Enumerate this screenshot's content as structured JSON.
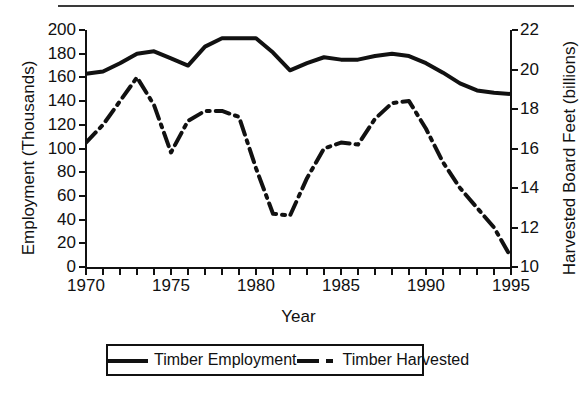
{
  "figure": {
    "has_top_rule": true,
    "background_color": "#ffffff",
    "line_color": "#111111"
  },
  "legend": {
    "position": "below-plot",
    "items": [
      {
        "label": "Timber Employment",
        "style": "solid",
        "icon": "solid-line-swatch-icon"
      },
      {
        "label": "Timber Harvested",
        "style": "dashdot",
        "icon": "dashdot-line-swatch-icon"
      }
    ]
  },
  "chart_data": {
    "type": "line",
    "title": "",
    "subtitle": "",
    "xlabel": "Year",
    "ylabel": "Employment (Thousands)",
    "y2label": "Harvested Board Feet (billions)",
    "xlim": [
      1970,
      1995
    ],
    "ylim": [
      0,
      200
    ],
    "y2lim": [
      10,
      22
    ],
    "grid": false,
    "xticks": [
      1970,
      1975,
      1980,
      1985,
      1990,
      1995
    ],
    "xtick_labels": [
      "1970",
      "1975",
      "1980",
      "1985",
      "1990",
      "1995"
    ],
    "xtick_minor_step": 1,
    "yticks": [
      0,
      20,
      40,
      60,
      80,
      100,
      120,
      140,
      160,
      180,
      200
    ],
    "ytick_labels": [
      "0",
      "20",
      "40",
      "60",
      "80",
      "100",
      "120",
      "140",
      "160",
      "180",
      "200"
    ],
    "y2ticks": [
      10,
      12,
      14,
      16,
      18,
      20,
      22
    ],
    "y2tick_labels": [
      "10",
      "12",
      "14",
      "16",
      "18",
      "20",
      "22"
    ],
    "x": [
      1970,
      1971,
      1972,
      1973,
      1974,
      1975,
      1976,
      1977,
      1978,
      1979,
      1980,
      1981,
      1982,
      1983,
      1984,
      1985,
      1986,
      1987,
      1988,
      1989,
      1990,
      1991,
      1992,
      1993,
      1994,
      1995
    ],
    "series": [
      {
        "name": "Timber Employment",
        "axis": "left",
        "style": "solid",
        "units": "thousands",
        "values": [
          163,
          165,
          172,
          180,
          182,
          176,
          170,
          186,
          193,
          193,
          193,
          181,
          166,
          172,
          177,
          175,
          175,
          178,
          180,
          178,
          172,
          164,
          155,
          149,
          147,
          146
        ]
      },
      {
        "name": "Timber Harvested",
        "axis": "right",
        "style": "dashdot",
        "units": "billion board feet",
        "values": [
          16.3,
          17.2,
          18.4,
          19.6,
          18.2,
          15.8,
          17.4,
          17.9,
          17.9,
          17.6,
          15.0,
          12.7,
          12.6,
          14.5,
          16.0,
          16.3,
          16.2,
          17.5,
          18.3,
          18.4,
          17.0,
          15.3,
          14.0,
          13.0,
          12.0,
          10.5
        ]
      }
    ]
  }
}
